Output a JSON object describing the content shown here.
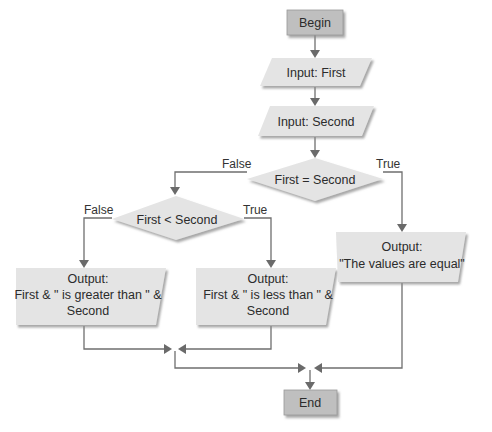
{
  "colors": {
    "terminal_fill": "#bfbfbf",
    "shape_fill": "#e4e4e4",
    "shadow": "#a8a8a8",
    "line": "#6f6f6f",
    "text": "#2b2b2b"
  },
  "nodes": {
    "begin": {
      "label": "Begin",
      "shape": "terminal"
    },
    "input_first": {
      "label": "Input: First",
      "shape": "parallelogram"
    },
    "input_second": {
      "label": "Input: Second",
      "shape": "parallelogram"
    },
    "decision_equal": {
      "label": "First = Second",
      "shape": "diamond"
    },
    "decision_less": {
      "label": "First < Second",
      "shape": "diamond"
    },
    "output_greater": {
      "shape": "parallelogram",
      "line1": "Output:",
      "line2": "First & \" is greater than \" &",
      "line3": "Second"
    },
    "output_less": {
      "shape": "parallelogram",
      "line1": "Output:",
      "line2": "First & \" is less than \" &",
      "line3": "Second"
    },
    "output_equal": {
      "shape": "parallelogram",
      "line1": "Output:",
      "line2": "\"The values are equal\""
    },
    "end": {
      "label": "End",
      "shape": "terminal"
    }
  },
  "edges": {
    "equal_false": "False",
    "equal_true": "True",
    "less_false": "False",
    "less_true": "True"
  }
}
